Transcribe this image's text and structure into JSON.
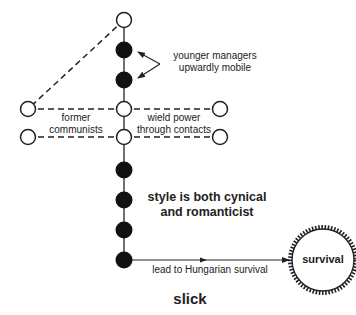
{
  "diagram": {
    "annotations": {
      "younger_managers_line1": "younger managers",
      "younger_managers_line2": "upwardly mobile",
      "former_communists_line1": "former",
      "former_communists_line2": "communists",
      "wield_power_line1": "wield power",
      "wield_power_line2": "through contacts",
      "style_line1": "style is both cynical",
      "style_line2": "and romanticist",
      "lead_to": "lead to Hungarian survival",
      "survival": "survival",
      "title": "slick"
    },
    "nodes": {
      "spine_x": 124,
      "open": [
        {
          "id": "top",
          "x": 124,
          "y": 20
        },
        {
          "id": "mid-upper",
          "x": 124,
          "y": 109
        },
        {
          "id": "mid-lower",
          "x": 124,
          "y": 137
        },
        {
          "id": "left-upper",
          "x": 28,
          "y": 109
        },
        {
          "id": "left-lower",
          "x": 28,
          "y": 137
        },
        {
          "id": "right-upper",
          "x": 220,
          "y": 109
        },
        {
          "id": "right-lower",
          "x": 220,
          "y": 137
        }
      ],
      "filled": [
        {
          "x": 124,
          "y": 50
        },
        {
          "x": 124,
          "y": 80
        },
        {
          "x": 124,
          "y": 170
        },
        {
          "x": 124,
          "y": 200
        },
        {
          "x": 124,
          "y": 230
        },
        {
          "x": 124,
          "y": 260
        }
      ],
      "target": {
        "label": "survival",
        "x": 323,
        "y": 260,
        "r": 33
      }
    },
    "colors": {
      "stroke": "#222222",
      "fill_dark": "#111111",
      "background": "#ffffff"
    }
  }
}
